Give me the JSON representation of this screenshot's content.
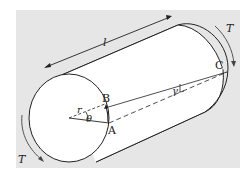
{
  "figure": {
    "background_color": "#e6e6e6",
    "stroke_color": "#222222",
    "labels": {
      "length": "l",
      "radius": "r",
      "angle_theta": "θ",
      "angle_gamma": "γ",
      "point_a": "A",
      "point_b": "B",
      "point_c": "C",
      "torque_left": "T",
      "torque_right": "T"
    }
  }
}
